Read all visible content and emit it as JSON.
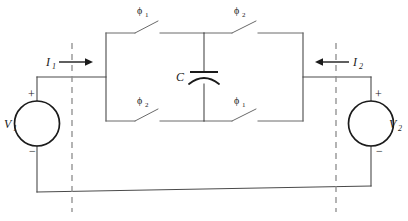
{
  "figure": {
    "type": "circuit-schematic",
    "background_color": "#ffffff",
    "wire_color": "#4a4a4a",
    "ink_color": "#1b1b1b",
    "dashed_color": "#8c8c8c"
  },
  "sources": {
    "left": {
      "label": "V",
      "subscript": "1",
      "plus": "+",
      "minus": "−"
    },
    "right": {
      "label": "V",
      "subscript": "2",
      "plus": "+",
      "minus": "−"
    }
  },
  "currents": {
    "left": {
      "label": "I",
      "subscript": "1",
      "direction": "right"
    },
    "right": {
      "label": "I",
      "subscript": "2",
      "direction": "left"
    }
  },
  "capacitor": {
    "label": "C"
  },
  "switches": [
    {
      "id": "top-left",
      "phase": "ϕ",
      "subscript": "1"
    },
    {
      "id": "top-right",
      "phase": "ϕ",
      "subscript": "2"
    },
    {
      "id": "bottom-left",
      "phase": "ϕ",
      "subscript": "2"
    },
    {
      "id": "bottom-right",
      "phase": "ϕ",
      "subscript": "1"
    }
  ],
  "port_markers": {
    "left": "dashed-port-line",
    "right": "dashed-port-line"
  }
}
